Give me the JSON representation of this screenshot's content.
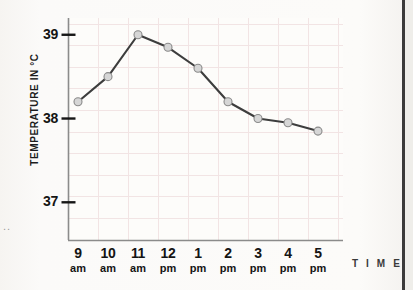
{
  "chart_data": {
    "type": "line",
    "title": "",
    "subtitle": "",
    "xlabel": "T I M E",
    "ylabel": "TEMPERATURE IN  °C",
    "categories": [
      "9 am",
      "10 am",
      "11 am",
      "12 pm",
      "1 pm",
      "2 pm",
      "3 pm",
      "4 pm",
      "5 pm"
    ],
    "x_tick_hours": [
      "9",
      "10",
      "11",
      "12",
      "1",
      "2",
      "3",
      "4",
      "5"
    ],
    "x_tick_meridiem": [
      "am",
      "am",
      "am",
      "pm",
      "pm",
      "pm",
      "pm",
      "pm",
      "pm"
    ],
    "values": [
      38.2,
      38.5,
      39.0,
      38.85,
      38.6,
      38.2,
      38.0,
      37.95,
      37.85
    ],
    "y_ticks": [
      39,
      38,
      37
    ],
    "y_tick_labels": [
      "39",
      "38",
      "37"
    ],
    "ylim": [
      36.55,
      39.2
    ],
    "grid": true,
    "legend": null,
    "series": [
      {
        "name": "Temperature",
        "values": [
          38.2,
          38.5,
          39.0,
          38.85,
          38.6,
          38.2,
          38.0,
          37.95,
          37.85
        ]
      }
    ],
    "colors": {
      "line": "#3d3d3d",
      "marker_fill": "#d6d6d6",
      "marker_stroke": "#8a8a8a",
      "axis": "#7b7b7b",
      "grid": "#f0e2e2",
      "text": "#141414",
      "background": "#fbfaf8"
    }
  },
  "margin_marks": ".."
}
